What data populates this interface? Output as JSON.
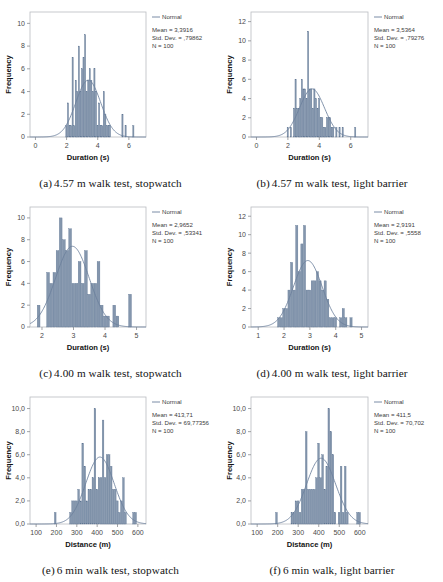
{
  "figure": {
    "background": "#ffffff",
    "bar_fill": "#8496ad",
    "bar_stroke": "#5c7391",
    "curve_color": "#6b7f9c",
    "frame_color": "#b9bcc0",
    "axis_color": "#8a8d91"
  },
  "panels": [
    {
      "id": "a",
      "caption_index": "(a)",
      "caption_text": "4.57 m walk test, stopwatch",
      "legend_label": "Normal",
      "stats": {
        "mean": "Mean = 3,3916",
        "std_dev": "Std. Dev. = ,79862",
        "n": "N = 100"
      },
      "chart_data": {
        "type": "bar",
        "title": "",
        "subtitle": "",
        "xlabel": "Duration (s)",
        "ylabel": "Frequency",
        "xlim": [
          -0.35,
          7.1
        ],
        "ylim": [
          0,
          11
        ],
        "xticks": [
          0,
          2,
          4,
          6
        ],
        "xtick_labels": [
          "0",
          "2",
          "4",
          "6"
        ],
        "yticks": [
          0,
          2,
          4,
          6,
          8,
          10
        ],
        "ytick_labels": [
          "0",
          "2",
          "4",
          "6",
          "8",
          "10"
        ],
        "grid": false,
        "legend_position": "right-top",
        "bin_width": 0.1,
        "bin_starts": [
          1.95,
          2.05,
          2.15,
          2.25,
          2.35,
          2.45,
          2.55,
          2.65,
          2.75,
          2.85,
          2.95,
          3.05,
          3.15,
          3.25,
          3.35,
          3.45,
          3.55,
          3.65,
          3.75,
          3.85,
          3.95,
          4.05,
          4.15,
          4.25,
          4.35,
          4.45,
          4.55,
          4.65,
          4.75,
          5.55,
          5.75,
          6.25
        ],
        "values": [
          1,
          3,
          1,
          1,
          7,
          1,
          5,
          4,
          8,
          4,
          6,
          7,
          9,
          4,
          5,
          6,
          5,
          4,
          6,
          4,
          1,
          3,
          1,
          1,
          4,
          2,
          1,
          1,
          1,
          2,
          1,
          1
        ],
        "curve": {
          "name": "Normal",
          "mean": 3.3916,
          "std": 0.79862,
          "n": 100,
          "scale_peak": 5.0
        }
      }
    },
    {
      "id": "b",
      "caption_index": "(b)",
      "caption_text": "4.57 m walk test, light barrier",
      "legend_label": "Normal",
      "stats": {
        "mean": "Mean = 3,5364",
        "std_dev": "Std. Dev. = ,79276",
        "n": "N = 100"
      },
      "chart_data": {
        "type": "bar",
        "title": "",
        "subtitle": "",
        "xlabel": "Duration (s)",
        "ylabel": "Frequency",
        "xlim": [
          -0.35,
          7.1
        ],
        "ylim": [
          0,
          13
        ],
        "xticks": [
          0,
          2,
          4,
          6
        ],
        "xtick_labels": [
          "0",
          "2",
          "4",
          "6"
        ],
        "yticks": [
          0,
          2,
          4,
          6,
          8,
          10,
          12
        ],
        "ytick_labels": [
          "0",
          "2",
          "4",
          "6",
          "8",
          "10",
          "12"
        ],
        "grid": false,
        "legend_position": "right-top",
        "bin_width": 0.1,
        "bin_starts": [
          1.95,
          2.15,
          2.35,
          2.45,
          2.55,
          2.65,
          2.75,
          2.85,
          2.95,
          3.05,
          3.15,
          3.25,
          3.35,
          3.45,
          3.55,
          3.65,
          3.75,
          3.85,
          3.95,
          4.05,
          4.15,
          4.25,
          4.35,
          4.45,
          4.55,
          4.65,
          4.75,
          4.85,
          5.05,
          5.25,
          5.45,
          6.25
        ],
        "values": [
          1,
          1,
          3,
          6,
          3,
          3,
          4,
          6,
          5,
          5,
          4,
          11,
          5,
          5,
          3,
          5,
          4,
          3,
          4,
          2,
          2,
          1,
          1,
          2,
          2,
          2,
          1,
          1,
          1,
          1,
          1,
          1
        ],
        "curve": {
          "name": "Normal",
          "mean": 3.5364,
          "std": 0.79276,
          "n": 100,
          "scale_peak": 5.0
        }
      }
    },
    {
      "id": "c",
      "caption_index": "(c)",
      "caption_text": "4.00 m walk test, stopwatch",
      "legend_label": "Normal",
      "stats": {
        "mean": "Mean = 2,9652",
        "std_dev": "Std. Dev. = ,53341",
        "n": "N = 100"
      },
      "chart_data": {
        "type": "bar",
        "title": "",
        "subtitle": "",
        "xlabel": "Duration (s)",
        "ylabel": "Frequency",
        "xlim": [
          1.62,
          5.3
        ],
        "ylim": [
          0,
          11
        ],
        "xticks": [
          2,
          3,
          4,
          5
        ],
        "xtick_labels": [
          "2",
          "3",
          "4",
          "5"
        ],
        "yticks": [
          0,
          2,
          4,
          6,
          8,
          10
        ],
        "ytick_labels": [
          "0",
          "2",
          "4",
          "6",
          "8",
          "10"
        ],
        "grid": false,
        "legend_position": "right-top",
        "bin_width": 0.1,
        "bin_starts": [
          1.85,
          2.15,
          2.25,
          2.35,
          2.45,
          2.55,
          2.65,
          2.75,
          2.85,
          2.95,
          3.05,
          3.15,
          3.25,
          3.35,
          3.45,
          3.55,
          3.65,
          3.75,
          3.85,
          3.95,
          4.05,
          4.25,
          4.35,
          4.75
        ],
        "values": [
          2,
          5,
          4,
          5,
          7,
          10,
          8,
          7,
          9,
          4,
          4,
          6,
          4,
          7,
          3,
          4,
          4,
          6,
          2,
          1,
          1,
          2,
          1,
          3
        ],
        "curve": {
          "name": "Normal",
          "mean": 2.9652,
          "std": 0.53341,
          "n": 100,
          "scale_peak": 7.4
        }
      }
    },
    {
      "id": "d",
      "caption_index": "(d)",
      "caption_text": "4.00 m walk test, light barrier",
      "legend_label": "Normal",
      "stats": {
        "mean": "Mean = 2,9191",
        "std_dev": "Std. Dev. = ,5558",
        "n": "N = 100"
      },
      "chart_data": {
        "type": "bar",
        "title": "",
        "subtitle": "",
        "xlabel": "Duration (s)",
        "ylabel": "Frequency",
        "xlim": [
          0.72,
          5.25
        ],
        "ylim": [
          0,
          13
        ],
        "xticks": [
          1,
          2,
          3,
          4,
          5
        ],
        "xtick_labels": [
          "1",
          "2",
          "3",
          "4",
          "5"
        ],
        "yticks": [
          0,
          2,
          4,
          6,
          8,
          10,
          12
        ],
        "ytick_labels": [
          "0",
          "2",
          "4",
          "6",
          "8",
          "10",
          "12"
        ],
        "grid": false,
        "legend_position": "right-top",
        "bin_width": 0.1,
        "bin_starts": [
          1.75,
          1.85,
          1.95,
          2.05,
          2.15,
          2.25,
          2.35,
          2.45,
          2.55,
          2.65,
          2.75,
          2.85,
          2.95,
          3.05,
          3.15,
          3.25,
          3.35,
          3.45,
          3.55,
          3.65,
          3.75,
          3.85,
          3.95,
          4.15,
          4.25,
          4.35,
          4.55
        ],
        "values": [
          1,
          1,
          2,
          2,
          4,
          7,
          4,
          11,
          6,
          9,
          11,
          4,
          4,
          5,
          5,
          6,
          5,
          4,
          5,
          3,
          1,
          1,
          1,
          1,
          2,
          1,
          1
        ],
        "curve": {
          "name": "Normal",
          "mean": 2.9191,
          "std": 0.5558,
          "n": 100,
          "scale_peak": 7.2
        }
      }
    },
    {
      "id": "e",
      "caption_index": "(e)",
      "caption_text": "6 min walk test, stopwatch",
      "legend_label": "Normal",
      "stats": {
        "mean": "Mean = 413,71",
        "std_dev": "Std. Dev. = 69,77356",
        "n": "N = 100"
      },
      "chart_data": {
        "type": "bar",
        "title": "",
        "subtitle": "",
        "xlabel": "Distance (m)",
        "ylabel": "Frequency",
        "xlim": [
          70,
          640
        ],
        "ylim": [
          0,
          11
        ],
        "xticks": [
          100,
          200,
          300,
          400,
          500,
          600
        ],
        "xtick_labels": [
          "100",
          "200",
          "300",
          "400",
          "500",
          "600"
        ],
        "yticks": [
          0,
          2,
          4,
          6,
          8,
          10
        ],
        "ytick_labels": [
          "0,0",
          "2,0",
          "4,0",
          "6,0",
          "8,0",
          "10,0"
        ],
        "grid": false,
        "legend_position": "right-top",
        "bin_width": 10,
        "bin_starts": [
          190,
          265,
          275,
          285,
          295,
          305,
          315,
          325,
          335,
          345,
          355,
          365,
          375,
          385,
          395,
          405,
          415,
          425,
          435,
          445,
          455,
          465,
          475,
          485,
          495,
          505,
          515,
          525,
          535,
          575,
          585
        ],
        "values": [
          1,
          1,
          2,
          2,
          2,
          3,
          2,
          7,
          5,
          2,
          3,
          3,
          4,
          10,
          3,
          4,
          4,
          9,
          4,
          6,
          6,
          5,
          3,
          3,
          2,
          1,
          2,
          4,
          1,
          1,
          1
        ],
        "curve": {
          "name": "Normal",
          "mean": 413.71,
          "std": 69.77356,
          "n": 100,
          "scale_peak": 5.8
        }
      }
    },
    {
      "id": "f",
      "caption_index": "(f)",
      "caption_text": "6 min walk, light barrier",
      "legend_label": "Normal",
      "stats": {
        "mean": "Mean = 411,5",
        "std_dev": "Std. Dev. = 70,702",
        "n": "N = 100"
      },
      "chart_data": {
        "type": "bar",
        "title": "",
        "subtitle": "",
        "xlabel": "Distance (m)",
        "ylabel": "Frequency",
        "xlim": [
          70,
          640
        ],
        "ylim": [
          0,
          11
        ],
        "xticks": [
          100,
          200,
          300,
          400,
          500,
          600
        ],
        "xtick_labels": [
          "100",
          "200",
          "300",
          "400",
          "500",
          "600"
        ],
        "yticks": [
          0,
          2,
          4,
          6,
          8,
          10
        ],
        "ytick_labels": [
          "0,0",
          "2,0",
          "4,0",
          "6,0",
          "8,0",
          "10,0"
        ],
        "grid": false,
        "legend_position": "right-top",
        "bin_width": 10,
        "bin_starts": [
          190,
          265,
          275,
          285,
          295,
          305,
          315,
          325,
          335,
          345,
          355,
          365,
          375,
          385,
          395,
          405,
          415,
          425,
          435,
          445,
          455,
          465,
          475,
          495,
          505,
          515,
          525,
          535,
          585,
          595
        ],
        "values": [
          1,
          1,
          1,
          2,
          2,
          1,
          3,
          3,
          8,
          3,
          3,
          3,
          3,
          4,
          7,
          4,
          6,
          3,
          5,
          10,
          8,
          6,
          1,
          1,
          5,
          1,
          5,
          1,
          1,
          1
        ],
        "curve": {
          "name": "Normal",
          "mean": 411.5,
          "std": 70.702,
          "n": 100,
          "scale_peak": 5.7
        }
      }
    }
  ]
}
